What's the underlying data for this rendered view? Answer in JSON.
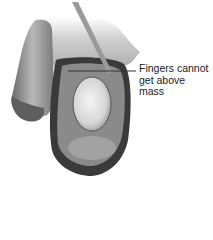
{
  "figure": {
    "colors": {
      "background": "#ffffff",
      "dark_tissue": "#3a3a3a",
      "mid_tissue": "#8a8a8a",
      "light_tissue": "#d8d8d8",
      "leader_line": "#333333",
      "label_text": "#222222"
    }
  },
  "annotation": {
    "lines": [
      "Fingers cannot",
      "get above",
      "mass"
    ]
  }
}
